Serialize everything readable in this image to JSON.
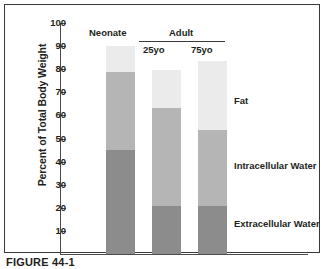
{
  "caption": "FIGURE 44-1",
  "chart_data": {
    "type": "bar",
    "subtype": "stacked",
    "title": "",
    "xlabel": "",
    "ylabel": "Percent of Total Body Weight",
    "ylim": [
      0,
      100
    ],
    "ytick_labels": [
      "100",
      "90",
      "80",
      "70",
      "60",
      "50",
      "40",
      "30",
      "20",
      "10"
    ],
    "ytick_values": [
      100,
      90,
      80,
      70,
      60,
      50,
      40,
      30,
      20,
      10
    ],
    "grid": false,
    "legend_position": "right",
    "categories": [
      "Neonate",
      "25yo",
      "75yo"
    ],
    "group_headings": [
      {
        "label": "Neonate",
        "spans": [
          "Neonate"
        ]
      },
      {
        "label": "Adult",
        "spans": [
          "25yo",
          "75yo"
        ]
      }
    ],
    "series": [
      {
        "name": "Extracellular Water",
        "color": "#8c8c8c",
        "values": [
          45,
          21,
          21
        ]
      },
      {
        "name": "Intracellular Water",
        "color": "#b5b5b5",
        "values": [
          34,
          42,
          32.5
        ]
      },
      {
        "name": "Fat",
        "color": "#ebebeb",
        "values": [
          11,
          16.5,
          30
        ]
      }
    ],
    "totals": [
      90,
      79.5,
      83.5
    ],
    "annotations": []
  },
  "axis": {
    "y_title": "Percent of Total Body Weight"
  },
  "headings": {
    "neonate": "Neonate",
    "adult": "Adult",
    "age_25": "25yo",
    "age_75": "75yo"
  },
  "legend": {
    "fat": "Fat",
    "intracellular": "Intracellular Water",
    "extracellular": "Extracellular Water"
  },
  "colors": {
    "fat": "#ebebeb",
    "intracellular": "#b5b5b5",
    "extracellular": "#8c8c8c",
    "axis": "#4a4a4a",
    "text": "#231f20",
    "border": "#3a3a3a"
  }
}
